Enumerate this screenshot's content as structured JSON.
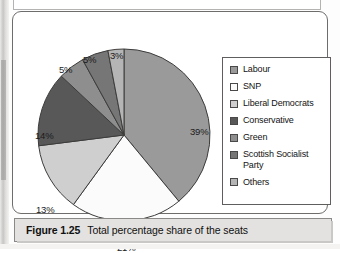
{
  "figure": {
    "caption_label": "Figure 1.25",
    "caption_text": "Total percentage share of the seats"
  },
  "legend": {
    "items": [
      {
        "label": "Labour",
        "color": "#9a9a9a"
      },
      {
        "label": "SNP",
        "color": "#fbfbfb"
      },
      {
        "label": "Liberal Democrats",
        "color": "#cfcfcf"
      },
      {
        "label": "Conservative",
        "color": "#585858"
      },
      {
        "label": "Green",
        "color": "#8e8e8e"
      },
      {
        "label": "Scottish Socialist Party",
        "color": "#767676"
      },
      {
        "label": "Others",
        "color": "#b5b5b5"
      }
    ]
  },
  "chart_data": {
    "type": "pie",
    "title": "Total percentage share of the seats",
    "unit": "%",
    "legend_position": "right",
    "categories": [
      "Labour",
      "SNP",
      "Liberal Democrats",
      "Conservative",
      "Green",
      "Scottish Socialist Party",
      "Others"
    ],
    "values": [
      39,
      21,
      13,
      14,
      5,
      5,
      3
    ],
    "labels": [
      "39%",
      "21%",
      "13%",
      "14%",
      "5%",
      "5%",
      "3%"
    ],
    "colors": [
      "#9a9a9a",
      "#fbfbfb",
      "#cfcfcf",
      "#585858",
      "#8e8e8e",
      "#767676",
      "#b5b5b5"
    ],
    "start_angle_deg": 0,
    "direction": "clockwise",
    "label_positions": [
      {
        "label": "39%",
        "left": 155,
        "top": 80
      },
      {
        "label": "21%",
        "left": 82,
        "top": 196
      },
      {
        "label": "13%",
        "left": 1,
        "top": 158
      },
      {
        "label": "14%",
        "left": 0,
        "top": 84
      },
      {
        "label": "5%",
        "left": 24,
        "top": 18
      },
      {
        "label": "5%",
        "left": 48,
        "top": 8
      },
      {
        "label": "3%",
        "left": 75,
        "top": 4
      }
    ]
  }
}
